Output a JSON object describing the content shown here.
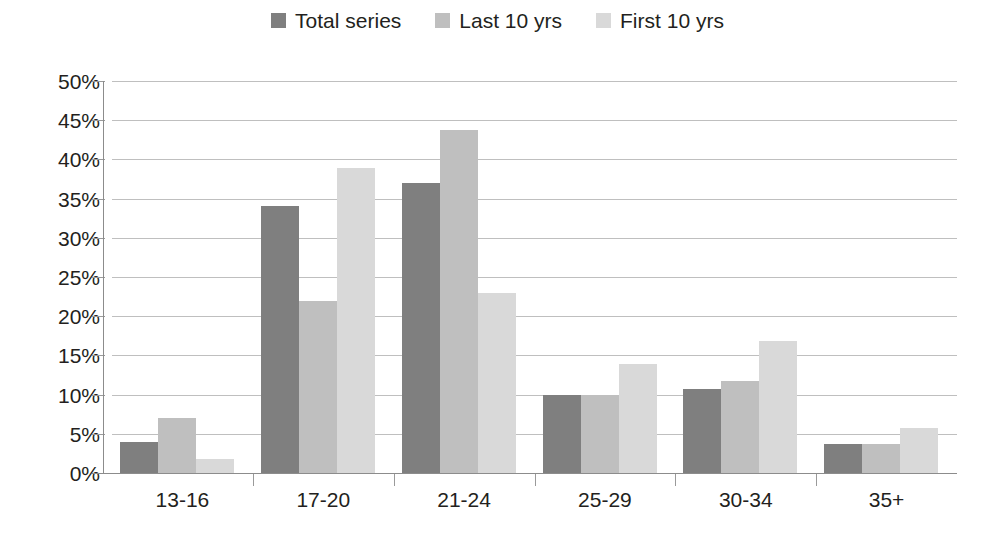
{
  "chart_data": {
    "type": "bar",
    "title": "",
    "subtitle": "",
    "xlabel": "",
    "ylabel": "",
    "categories": [
      "13-16",
      "17-20",
      "21-24",
      "25-29",
      "30-34",
      "35+"
    ],
    "series": [
      {
        "name": "Total series",
        "color": "#7f7f7f",
        "values": [
          3.9,
          34.0,
          37.0,
          9.9,
          10.7,
          3.7
        ]
      },
      {
        "name": "Last 10 yrs",
        "color": "#bfbfbf",
        "values": [
          7.0,
          22.0,
          43.8,
          9.9,
          11.8,
          3.7
        ]
      },
      {
        "name": "First 10 yrs",
        "color": "#d9d9d9",
        "values": [
          1.8,
          38.9,
          23.0,
          13.9,
          16.8,
          5.7
        ]
      }
    ],
    "ylim": [
      0,
      50
    ],
    "y_tick_values": [
      0,
      5,
      10,
      15,
      20,
      25,
      30,
      35,
      40,
      45,
      50
    ],
    "y_tick_labels": [
      "0%",
      "5%",
      "10%",
      "15%",
      "20%",
      "25%",
      "30%",
      "35%",
      "40%",
      "45%",
      "50%"
    ],
    "value_suffix": "%",
    "grid": true,
    "grid_axis": "y",
    "grid_color": "#bfbfbf",
    "axis_color": "#8c8c8c",
    "legend_position": "top-center",
    "background_color": "#ffffff",
    "text_color": "#231f20"
  }
}
